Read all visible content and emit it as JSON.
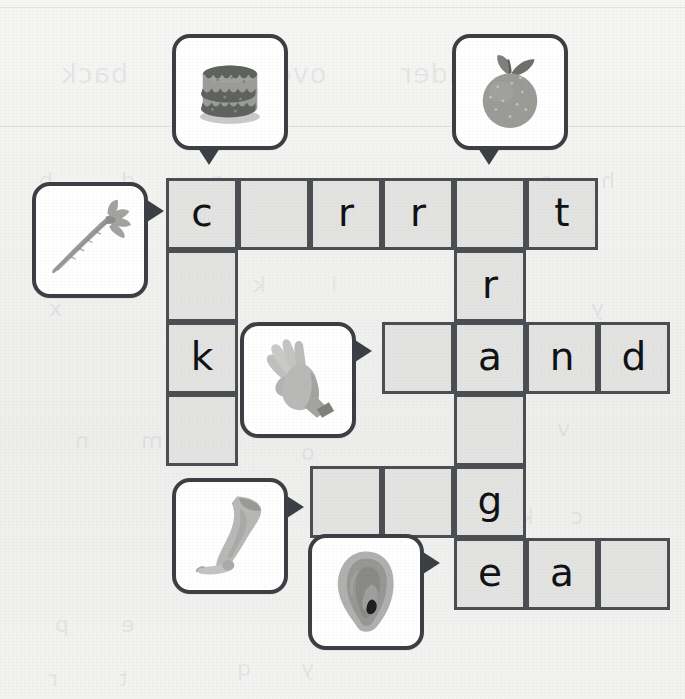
{
  "worksheet": {
    "type": "picture-crossword",
    "grid": {
      "origin_x": 166,
      "origin_y": 178,
      "cell_size": 72,
      "columns": 7,
      "rows": 6,
      "cells": [
        {
          "row": 0,
          "col": 0,
          "letter": "c"
        },
        {
          "row": 0,
          "col": 1,
          "letter": ""
        },
        {
          "row": 0,
          "col": 2,
          "letter": "r"
        },
        {
          "row": 0,
          "col": 3,
          "letter": "r"
        },
        {
          "row": 0,
          "col": 4,
          "letter": ""
        },
        {
          "row": 0,
          "col": 5,
          "letter": "t"
        },
        {
          "row": 1,
          "col": 0,
          "letter": ""
        },
        {
          "row": 1,
          "col": 4,
          "letter": "r"
        },
        {
          "row": 2,
          "col": 0,
          "letter": "k"
        },
        {
          "row": 2,
          "col": 3,
          "letter": ""
        },
        {
          "row": 2,
          "col": 4,
          "letter": "a"
        },
        {
          "row": 2,
          "col": 5,
          "letter": "n"
        },
        {
          "row": 2,
          "col": 6,
          "letter": "d"
        },
        {
          "row": 3,
          "col": 0,
          "letter": ""
        },
        {
          "row": 3,
          "col": 4,
          "letter": ""
        },
        {
          "row": 4,
          "col": 2,
          "letter": ""
        },
        {
          "row": 4,
          "col": 3,
          "letter": ""
        },
        {
          "row": 4,
          "col": 4,
          "letter": "g"
        },
        {
          "row": 5,
          "col": 4,
          "letter": "e"
        },
        {
          "row": 5,
          "col": 5,
          "letter": "a"
        },
        {
          "row": 5,
          "col": 6,
          "letter": ""
        }
      ]
    },
    "clues": [
      {
        "id": "cake",
        "icon": "cake-icon",
        "label": "cake",
        "x": 172,
        "y": 34,
        "direction": "down",
        "pointer_x": 198,
        "pointer_y": 148
      },
      {
        "id": "orange",
        "icon": "orange-icon",
        "label": "orange",
        "x": 452,
        "y": 34,
        "direction": "down",
        "pointer_x": 478,
        "pointer_y": 148
      },
      {
        "id": "carrot",
        "icon": "carrot-icon",
        "label": "carrot",
        "x": 32,
        "y": 182,
        "direction": "right",
        "pointer_x": 147,
        "pointer_y": 200
      },
      {
        "id": "hand",
        "icon": "hand-icon",
        "label": "hand",
        "x": 240,
        "y": 322,
        "direction": "right",
        "pointer_x": 355,
        "pointer_y": 340
      },
      {
        "id": "leg",
        "icon": "leg-icon",
        "label": "leg",
        "x": 172,
        "y": 478,
        "direction": "right",
        "pointer_x": 287,
        "pointer_y": 496
      },
      {
        "id": "ear",
        "icon": "ear-icon",
        "label": "ear",
        "x": 308,
        "y": 534,
        "direction": "right",
        "pointer_x": 423,
        "pointer_y": 552
      }
    ],
    "ghost_text": [
      {
        "text": "back",
        "x": 60,
        "y": 58,
        "size": "lg"
      },
      {
        "text": "over",
        "x": 262,
        "y": 58,
        "size": "lg"
      },
      {
        "text": "under",
        "x": 400,
        "y": 58,
        "size": "lg"
      },
      {
        "text": "b",
        "x": 38,
        "y": 168,
        "size": "sm"
      },
      {
        "text": "d",
        "x": 120,
        "y": 168,
        "size": "sm"
      },
      {
        "text": "g",
        "x": 210,
        "y": 168,
        "size": "sm"
      },
      {
        "text": "s",
        "x": 540,
        "y": 168,
        "size": "sm"
      },
      {
        "text": "h",
        "x": 600,
        "y": 168,
        "size": "sm"
      },
      {
        "text": "k",
        "x": 252,
        "y": 272,
        "size": "sm"
      },
      {
        "text": "l",
        "x": 330,
        "y": 272,
        "size": "sm"
      },
      {
        "text": "x",
        "x": 48,
        "y": 296,
        "size": "sm"
      },
      {
        "text": "y",
        "x": 590,
        "y": 296,
        "size": "sm"
      },
      {
        "text": "m",
        "x": 140,
        "y": 428,
        "size": "sm"
      },
      {
        "text": "n",
        "x": 74,
        "y": 428,
        "size": "sm"
      },
      {
        "text": "y",
        "x": 480,
        "y": 416,
        "size": "sm"
      },
      {
        "text": "v",
        "x": 556,
        "y": 416,
        "size": "sm"
      },
      {
        "text": "o",
        "x": 300,
        "y": 440,
        "size": "sm"
      },
      {
        "text": "k",
        "x": 520,
        "y": 504,
        "size": "sm"
      },
      {
        "text": "c",
        "x": 570,
        "y": 504,
        "size": "sm"
      },
      {
        "text": "p",
        "x": 54,
        "y": 612,
        "size": "sm"
      },
      {
        "text": "e",
        "x": 120,
        "y": 612,
        "size": "sm"
      },
      {
        "text": "q",
        "x": 236,
        "y": 656,
        "size": "sm"
      },
      {
        "text": "y",
        "x": 300,
        "y": 656,
        "size": "sm"
      },
      {
        "text": "r",
        "x": 48,
        "y": 666,
        "size": "sm"
      },
      {
        "text": "t",
        "x": 118,
        "y": 666,
        "size": "sm"
      }
    ],
    "colors": {
      "paper": "#f2f2f0",
      "grid_line": "#4b4f54",
      "cell_fill": "#e3e4e2",
      "letter": "#111215",
      "card_border": "#3c4045",
      "card_fill": "#ffffff",
      "art_mid": "#9a9a98",
      "art_dark": "#6f7270",
      "art_light": "#c2c3c0"
    }
  }
}
